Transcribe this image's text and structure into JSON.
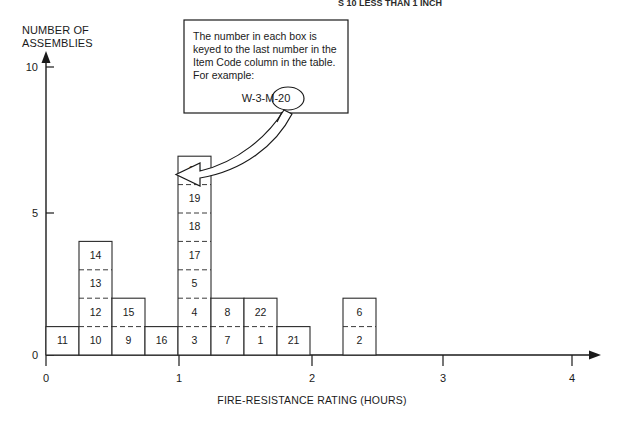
{
  "figure": {
    "top_partial_caption": "S 10 LESS THAN 1 INCH",
    "y_axis_title_line1": "NUMBER OF",
    "y_axis_title_line2": "ASSEMBLIES",
    "x_axis_title": "FIRE-RESISTANCE RATING (HOURS)",
    "ink_color": "#1a1a1a",
    "cell_stroke_color": "#3a3a3a",
    "background_color": "#ffffff"
  },
  "callout": {
    "line1": "The number in each box is",
    "line2": "keyed to the last number in the",
    "line3": "Item Code column in the table.",
    "line4": "For example:",
    "example_prefix": "W-3-M-",
    "example_circled": "20",
    "example_full": "W-3-M-20"
  },
  "chart_data": {
    "type": "bar",
    "title": "",
    "subtitle": "",
    "xlabel": "FIRE-RESISTANCE RATING (HOURS)",
    "ylabel": "NUMBER OF ASSEMBLIES",
    "xlim": [
      0,
      4.35
    ],
    "ylim": [
      0,
      10.6
    ],
    "xticks": [
      0,
      1,
      2,
      3,
      4
    ],
    "xtick_labels": [
      "0",
      "1",
      "2",
      "3",
      "4"
    ],
    "yticks": [
      0,
      5,
      10
    ],
    "ytick_labels": [
      "0",
      "5",
      "10"
    ],
    "grid": false,
    "legend": false,
    "bin_width": 0.25,
    "note": "Stacked histogram; each unit cell is labelled with the last number of an Item Code.",
    "bins": [
      {
        "x_start": 0.0,
        "x_end": 0.25,
        "count": 1,
        "cells": [
          "11"
        ]
      },
      {
        "x_start": 0.25,
        "x_end": 0.5,
        "count": 4,
        "cells": [
          "10",
          "12",
          "13",
          "14"
        ]
      },
      {
        "x_start": 0.5,
        "x_end": 0.75,
        "count": 3,
        "cells": [
          "9",
          "15"
        ]
      },
      {
        "x_start": 0.75,
        "x_end": 1.0,
        "count": 1,
        "cells": [
          "16"
        ]
      },
      {
        "x_start": 1.0,
        "x_end": 1.25,
        "count": 7,
        "cells": [
          "3",
          "4",
          "5",
          "17",
          "18",
          "19",
          "20"
        ]
      },
      {
        "x_start": 1.25,
        "x_end": 1.5,
        "count": 2,
        "cells": [
          "7",
          "8"
        ]
      },
      {
        "x_start": 1.5,
        "x_end": 1.75,
        "count": 2,
        "cells": [
          "1",
          "22"
        ]
      },
      {
        "x_start": 1.75,
        "x_end": 2.0,
        "count": 1,
        "cells": [
          "21"
        ]
      },
      {
        "x_start": 2.0,
        "x_end": 2.25,
        "count": 0,
        "cells": []
      },
      {
        "x_start": 2.25,
        "x_end": 2.5,
        "count": 2,
        "cells": [
          "2",
          "6"
        ]
      }
    ],
    "columns": [
      {
        "index": 0,
        "px_left": 46,
        "px_right": 79,
        "stack": [
          "11"
        ]
      },
      {
        "index": 1,
        "px_left": 79,
        "px_right": 112,
        "stack": [
          "10",
          "12",
          "13",
          "14"
        ]
      },
      {
        "index": 2,
        "px_left": 112,
        "px_right": 145,
        "stack": [
          "9",
          "15"
        ]
      },
      {
        "index": 3,
        "px_left": 145,
        "px_right": 178,
        "stack": [
          "16"
        ]
      },
      {
        "index": 4,
        "px_left": 178,
        "px_right": 211,
        "stack": [
          "3",
          "4",
          "5",
          "17",
          "18",
          "19",
          "20"
        ]
      },
      {
        "index": 5,
        "px_left": 211,
        "px_right": 244,
        "stack": [
          "7",
          "8"
        ]
      },
      {
        "index": 6,
        "px_left": 244,
        "px_right": 277,
        "stack": [
          "1",
          "22"
        ]
      },
      {
        "index": 7,
        "px_left": 277,
        "px_right": 310,
        "stack": [
          "21"
        ]
      },
      {
        "index": 8,
        "px_left": 310,
        "px_right": 343,
        "stack": []
      },
      {
        "index": 9,
        "px_left": 343,
        "px_right": 376,
        "stack": [
          "2",
          "6"
        ]
      }
    ]
  }
}
